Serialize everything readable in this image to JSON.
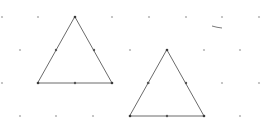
{
  "canvas": {
    "width": 271,
    "height": 137,
    "background": "#ffffff"
  },
  "colors": {
    "grid_dot": "#b8b8b8",
    "edge": "#6b6b6b",
    "vertex": "#3a3a3a",
    "midpoint": "#555555",
    "stray": "#7a7a7a"
  },
  "grid": {
    "description": "isometric dot grid",
    "rows": [
      {
        "y": 17,
        "xs": [
          2,
          38,
          75,
          112,
          149,
          186,
          222,
          259
        ]
      },
      {
        "y": 50,
        "xs": [
          20,
          56,
          94,
          130,
          167,
          204,
          240
        ]
      },
      {
        "y": 83,
        "xs": [
          2,
          38,
          75,
          112,
          149,
          186,
          222,
          259
        ]
      },
      {
        "y": 116,
        "xs": [
          20,
          56,
          93,
          130,
          167,
          204,
          240
        ]
      }
    ]
  },
  "triangles": [
    {
      "name": "triangle-left",
      "vertices": [
        [
          75,
          17
        ],
        [
          112,
          83
        ],
        [
          38,
          83
        ]
      ],
      "midpoints": [
        [
          94,
          50
        ],
        [
          75,
          83
        ],
        [
          56,
          50
        ]
      ]
    },
    {
      "name": "triangle-right",
      "vertices": [
        [
          167,
          50
        ],
        [
          204,
          116
        ],
        [
          130,
          116
        ]
      ],
      "midpoints": [
        [
          186,
          83
        ],
        [
          167,
          116
        ],
        [
          148,
          83
        ]
      ]
    }
  ],
  "stray_marks": [
    {
      "from": [
        212,
        26
      ],
      "to": [
        222,
        28
      ]
    }
  ]
}
